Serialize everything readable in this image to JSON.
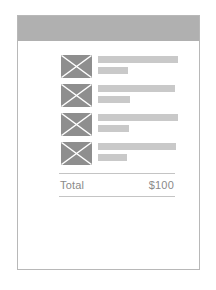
{
  "page": {
    "background_color": "#ffffff",
    "width": 216,
    "height": 290
  },
  "card": {
    "border_color": "#b8b8b8",
    "background_color": "#ffffff",
    "header": {
      "color": "#b0b0b0",
      "label": ""
    }
  },
  "line_items": [
    {
      "thumbnail": "placeholder-image-x",
      "title_placeholder_width": "100%",
      "subtitle_placeholder_width": "38%"
    },
    {
      "thumbnail": "placeholder-image-x",
      "title_placeholder_width": "96%",
      "subtitle_placeholder_width": "40%"
    },
    {
      "thumbnail": "placeholder-image-x",
      "title_placeholder_width": "100%",
      "subtitle_placeholder_width": "39%"
    },
    {
      "thumbnail": "placeholder-image-x",
      "title_placeholder_width": "98%",
      "subtitle_placeholder_width": "36%"
    }
  ],
  "total": {
    "label": "Total",
    "value": "$100",
    "rule_color": "#c4c4c4",
    "text_color": "#8a8a8a"
  },
  "colors": {
    "header_gray": "#b0b0b0",
    "thumbnail_gray": "#8e8e8e",
    "placeholder_bar_gray": "#c9c9c9",
    "card_border": "#b8b8b8"
  }
}
